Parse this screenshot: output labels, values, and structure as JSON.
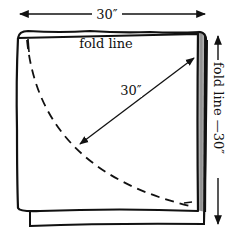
{
  "diagram": {
    "top_dimension": {
      "label": "30″"
    },
    "fold_line_top": {
      "label": "fold line"
    },
    "diagonal_dimension": {
      "label": "30″"
    },
    "right_label": {
      "fold_text": "fold line",
      "dimension": "30″"
    }
  },
  "colors": {
    "ink": "#111111",
    "background": "#ffffff",
    "fold_shade": "#9a9a9a"
  }
}
